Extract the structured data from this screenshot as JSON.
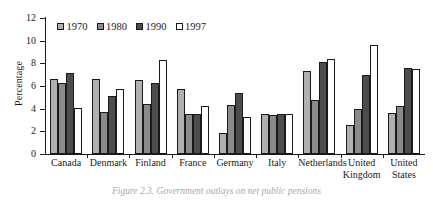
{
  "chart_data": {
    "type": "bar",
    "title": "",
    "xlabel": "",
    "ylabel": "Percentage",
    "ylim": [
      0,
      12
    ],
    "yticks": [
      0,
      2,
      4,
      6,
      8,
      10,
      12
    ],
    "grid": false,
    "legend_position": "top-center",
    "categories": [
      "Canada",
      "Denmark",
      "Finland",
      "France",
      "Germany",
      "Italy",
      "Netherlands",
      "United\nKingdom",
      "United\nStates"
    ],
    "series": [
      {
        "name": "1970",
        "color": "#b0b0b0",
        "values": [
          6.6,
          6.6,
          6.5,
          5.75,
          1.85,
          3.5,
          7.3,
          2.6,
          3.6
        ]
      },
      {
        "name": "1980",
        "color": "#8a8a8a",
        "values": [
          6.3,
          3.7,
          4.45,
          3.5,
          4.3,
          3.4,
          4.8,
          4.0,
          4.2
        ]
      },
      {
        "name": "1990",
        "color": "#4d4d4d",
        "values": [
          7.15,
          5.15,
          6.3,
          3.5,
          5.4,
          3.5,
          8.1,
          7.0,
          7.6
        ]
      },
      {
        "name": "1997",
        "color": "#ffffff",
        "values": [
          4.1,
          5.75,
          8.3,
          4.25,
          3.3,
          3.5,
          8.4,
          9.6,
          7.5
        ]
      }
    ]
  },
  "axis": {
    "y_title": "Percentage",
    "tick_labels": [
      "0",
      "2",
      "4",
      "6",
      "8",
      "10",
      "12"
    ]
  },
  "legend": {
    "entries": [
      "1970",
      "1980",
      "1990",
      "1997"
    ]
  },
  "caption": {
    "text": "Figure 2.3.  Government outlays on net public pensions"
  }
}
